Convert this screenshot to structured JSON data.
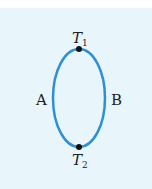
{
  "diagram": {
    "labels": {
      "top_point": "T",
      "top_sub": "1",
      "bottom_point": "T",
      "bottom_sub": "2",
      "left_path": "A",
      "right_path": "B"
    },
    "colors": {
      "background": "#e8f6fb",
      "loop": "#2d8fd5",
      "point": "#111111"
    }
  }
}
